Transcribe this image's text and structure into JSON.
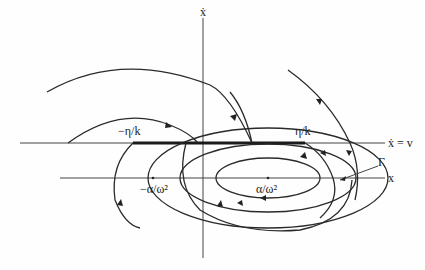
{
  "figure": {
    "type": "phase-portrait",
    "axes": {
      "vertical_label": "ẋ",
      "upper_horizontal_label": "ẋ = v",
      "lower_horizontal_label": "x"
    },
    "labels": {
      "neg_eta_k": "−η/k",
      "pos_eta_k": "η/k",
      "neg_alpha_omega": "−α/ω²",
      "pos_alpha_omega": "α/ω²",
      "gamma": "Γ"
    },
    "colors": {
      "ink": "#222222",
      "background": "#fefefe"
    }
  }
}
